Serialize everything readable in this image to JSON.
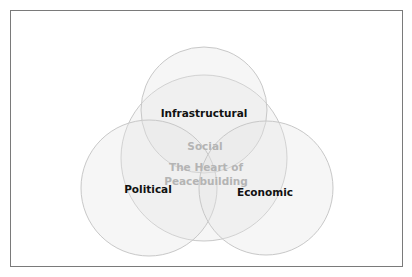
{
  "diagram": {
    "type": "venn",
    "circles": [
      {
        "id": "infrastructural",
        "label": "Infrastructural",
        "cx": 204,
        "cy": 110,
        "r": 63
      },
      {
        "id": "social",
        "label": "Social",
        "cx": 204,
        "cy": 158,
        "r": 83
      },
      {
        "id": "political",
        "label": "Political",
        "cx": 149,
        "cy": 188,
        "r": 68
      },
      {
        "id": "economic",
        "label": "Economic",
        "cx": 266,
        "cy": 188,
        "r": 67
      }
    ],
    "labels": {
      "infrastructural": "Infrastructural",
      "social": "Social",
      "political": "Political",
      "economic": "Economic",
      "center_line1": "The Heart of",
      "center_line2": "Peacebuilding"
    },
    "colors": {
      "circle_fill": "#e6e6e6",
      "circle_stroke": "#c8c8c8",
      "frame_border": "#7a7a7a",
      "label_text": "#111111",
      "center_text": "#b4b4b4"
    }
  }
}
